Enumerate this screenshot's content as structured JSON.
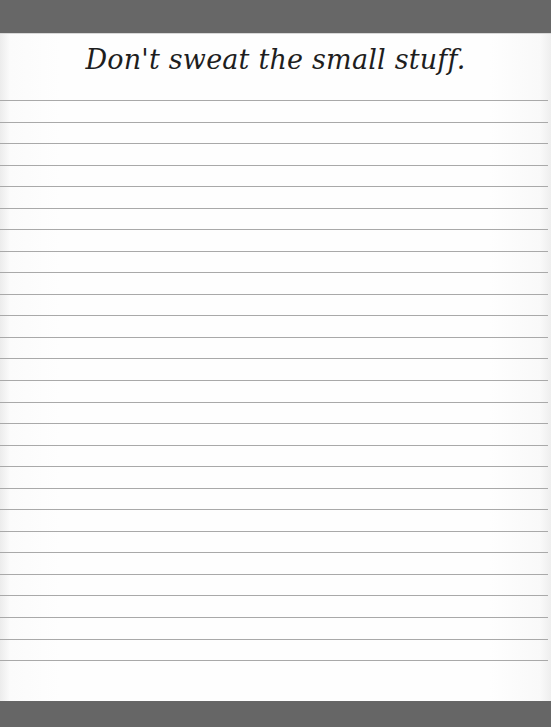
{
  "page": {
    "type": "lined-notepad",
    "header_text": "Don't sweat the small stuff.",
    "line_count": 27,
    "first_line_y": 100,
    "line_spacing": 21.54,
    "colors": {
      "band": "#676767",
      "paper": "#fefefe",
      "rule": "#a9a9a9",
      "text": "#1e1e1e"
    }
  }
}
